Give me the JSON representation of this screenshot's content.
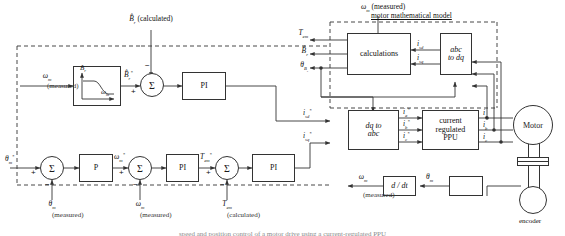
{
  "diagram": {
    "bottom_caption": "speed and position control of a motor drive using a current-regulated PPU",
    "colors": {
      "line": "#333333",
      "background": "#ffffff",
      "text": "#111111"
    }
  },
  "blocks": {
    "field_weakening": {
      "label": "",
      "y_axis": "B̂r",
      "x_axis": "ωm"
    },
    "pi_flux": {
      "label": "PI"
    },
    "p_position": {
      "label": "P"
    },
    "pi_speed": {
      "label": "PI"
    },
    "pi_torque": {
      "label": "PI"
    },
    "calculations": {
      "label": "calculations"
    },
    "abc_to_dq": {
      "line1": "abc",
      "line2": "to dq"
    },
    "dq_to_abc": {
      "line1": "dq to",
      "line2": "abc"
    },
    "current_ppu": {
      "line1": "current",
      "line2": "regulated",
      "line3": "PPU"
    },
    "motor": {
      "label": "Motor"
    },
    "differentiator": {
      "label": "d / dt"
    },
    "encoder_block": {
      "label": ""
    },
    "encoder": {
      "label": "encoder"
    }
  },
  "summers": {
    "flux": {
      "symbol": "Σ",
      "plus": "+",
      "minus": "−"
    },
    "position": {
      "symbol": "Σ",
      "plus": "+",
      "minus": "−"
    },
    "speed": {
      "symbol": "Σ",
      "plus": "+",
      "minus": "−"
    },
    "torque": {
      "symbol": "Σ",
      "plus": "+",
      "minus": "−"
    }
  },
  "signals": {
    "br_calculated_sym": "B̂r",
    "br_calculated_note": "(calculated)",
    "wm_measured_left_sym": "ωm",
    "wm_measured_left_note": "(measured)",
    "br_ref": "B̂r*",
    "theta_m_ref": "θm*",
    "theta_m_fb_sym": "θm",
    "theta_m_fb_note": "(measured)",
    "wm_ref": "ωm*",
    "wm_fb_sym": "ωm",
    "wm_fb_note": "(measured)",
    "tem_ref": "Tem*",
    "tem_fb_sym": "Tem",
    "tem_fb_note": "(calculated)",
    "wm_top_sym": "ωm",
    "wm_top_note": "(measured)",
    "motor_model_label": "motor mathematical model",
    "tem_out": "Tem",
    "br_out": "B̂r",
    "theta_br_out": "θBr",
    "isd_fb": "isd",
    "isq_fb": "isq",
    "isd_ref": "isd*",
    "isq_ref": "isq*",
    "ia_ref": "ia*",
    "ib_ref": "ib*",
    "ic_ref": "ic*",
    "ia_meas": "ia",
    "ib_meas": "ib",
    "ic_meas": "ic",
    "wm_out_sym": "ωm",
    "wm_out_note": "(measured)",
    "theta_m_out": "θm"
  }
}
